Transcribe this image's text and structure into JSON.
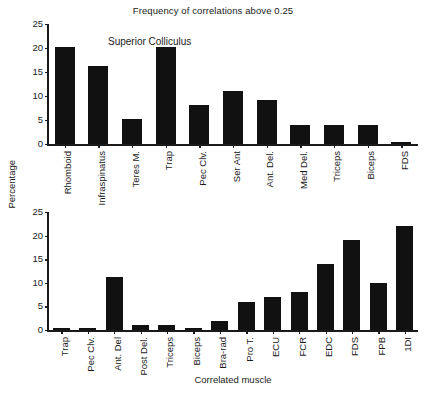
{
  "chart_data": [
    {
      "type": "bar",
      "title": "Frequency of correlations above 0.25",
      "panel_label": "Superior Colliculus",
      "xlabel": "",
      "ylabel": "Percentage",
      "ylim": [
        0,
        25
      ],
      "yticks": [
        0,
        5,
        10,
        15,
        20,
        25
      ],
      "grid": false,
      "legend": "none",
      "bar_color": "#111111",
      "categories": [
        "Rhomboid",
        "Infraspinatus",
        "Teres M.",
        "Trap",
        "Pec Clv.",
        "Ser Ant",
        "Ant. Del.",
        "Med Del.",
        "Triceps",
        "Biceps",
        "FDS"
      ],
      "values": [
        20.3,
        16.2,
        5.2,
        20.2,
        8.1,
        11.1,
        9.1,
        4.0,
        4.0,
        4.0,
        0.4
      ]
    },
    {
      "type": "bar",
      "title": "",
      "panel_label": "Motor Cortex",
      "xlabel": "Correlated muscle",
      "ylabel": "Percentage",
      "ylim": [
        0,
        25
      ],
      "yticks": [
        0,
        5,
        10,
        15,
        20,
        25
      ],
      "grid": false,
      "legend": "none",
      "bar_color": "#111111",
      "categories": [
        "Trap",
        "Pec Clv.",
        "Ant. Del",
        "Post Del.",
        "Triceps",
        "Biceps",
        "Bra-rad",
        "Pro T.",
        "ECU",
        "FCR",
        "EDC",
        "FDS",
        "FPB",
        "1DI"
      ],
      "values": [
        0.5,
        0.5,
        11.2,
        1.1,
        1.1,
        0.4,
        2.0,
        6.0,
        7.0,
        8.0,
        14.0,
        19.0,
        10.0,
        22.0
      ]
    }
  ],
  "figure": {
    "title": "Frequency of correlations above 0.25",
    "y_axis_title": "Percentage",
    "x_axis_title": "Correlated muscle"
  },
  "top_panel": {
    "note": "Superior Colliculus",
    "ytick_labels": [
      "25",
      "20",
      "15",
      "10",
      "5",
      "0"
    ],
    "categories": [
      "Rhomboid",
      "Infraspinatus",
      "Teres M.",
      "Trap",
      "Pec Clv.",
      "Ser Ant",
      "Ant. Del.",
      "Med Del.",
      "Triceps",
      "Biceps",
      "FDS"
    ]
  },
  "bottom_panel": {
    "note": "Motor Cortex",
    "ytick_labels": [
      "25",
      "20",
      "15",
      "10",
      "5",
      "0"
    ],
    "categories": [
      "Trap",
      "Pec Clv.",
      "Ant. Del",
      "Post Del.",
      "Triceps",
      "Biceps",
      "Bra-rad",
      "Pro T.",
      "ECU",
      "FCR",
      "EDC",
      "FDS",
      "FPB",
      "1DI"
    ]
  }
}
